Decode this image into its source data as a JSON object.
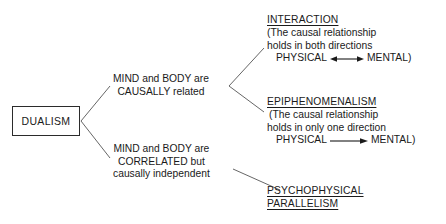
{
  "diagram": {
    "root": {
      "label": "DUALISM"
    },
    "branches": [
      {
        "id": "causal",
        "line1": "MIND and BODY are",
        "line2": "CAUSALLY related"
      },
      {
        "id": "correlated",
        "line1": "MIND and BODY are",
        "line2": "CORRELATED but",
        "line3": "causally independent"
      }
    ],
    "terms": [
      {
        "id": "interaction",
        "heading": "INTERACTION",
        "gloss_line1": "(The causal relationship",
        "gloss_line2": "holds in both directions",
        "arrow_left_label": "PHYSICAL",
        "arrow_right_label": "MENTAL)",
        "arrow_type": "double-headed"
      },
      {
        "id": "epiphenomenalism",
        "heading": "EPIPHENOMENALISM",
        "gloss_line1": "(The causal relationship",
        "gloss_line2": "holds in only one direction",
        "arrow_left_label": "PHYSICAL",
        "arrow_right_label": "MENTAL)",
        "arrow_type": "single-right"
      },
      {
        "id": "parallelism",
        "heading_line1": "PSYCHOPHYSICAL",
        "heading_line2": "PARALLELISM"
      }
    ],
    "colors": {
      "background": "#ffffff",
      "text": "#1a1a1a",
      "line": "#555555",
      "box_border": "#2b2b2b"
    }
  }
}
